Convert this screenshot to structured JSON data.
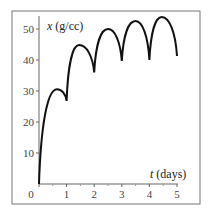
{
  "chart_data": {
    "type": "line",
    "title": "",
    "xlabel_var": "t",
    "xlabel_unit": "(days)",
    "ylabel_var": "x",
    "ylabel_unit": "(g/cc)",
    "xlim": [
      0,
      5
    ],
    "ylim": [
      0,
      55
    ],
    "x_ticks": [
      0,
      1,
      2,
      3,
      4,
      5
    ],
    "x_tick_labels": [
      "0",
      "1",
      "2",
      "3",
      "4",
      "5"
    ],
    "y_ticks": [
      10,
      20,
      30,
      40,
      50
    ],
    "y_tick_labels": [
      "10",
      "20",
      "30",
      "40",
      "50"
    ],
    "grid": false,
    "legend": null,
    "series": [
      {
        "name": "x(t)",
        "color": "#111111",
        "key_points": [
          {
            "t": 0.0,
            "x": 0
          },
          {
            "t": 0.65,
            "x": 30.6
          },
          {
            "t": 1.0,
            "x": 26.8
          },
          {
            "t": 1.45,
            "x": 44.8
          },
          {
            "t": 2.0,
            "x": 36.0
          },
          {
            "t": 2.5,
            "x": 50.0
          },
          {
            "t": 3.0,
            "x": 39.7
          },
          {
            "t": 3.5,
            "x": 52.6
          },
          {
            "t": 4.0,
            "x": 40.0
          },
          {
            "t": 4.45,
            "x": 53.9
          },
          {
            "t": 5.0,
            "x": 41.3
          }
        ]
      }
    ]
  }
}
